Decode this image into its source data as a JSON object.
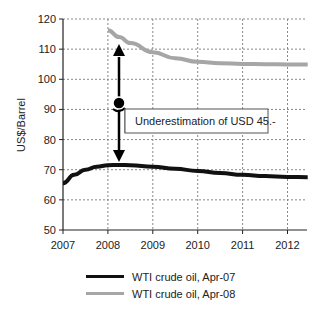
{
  "chart_data": {
    "type": "line",
    "title": "",
    "xlabel": "",
    "ylabel": "US$/Barrel",
    "xlim": [
      2007,
      2012.45
    ],
    "ylim": [
      50,
      120
    ],
    "x_ticks": [
      "2007",
      "2008",
      "2009",
      "2010",
      "2011",
      "2012"
    ],
    "y_ticks": [
      "50",
      "60",
      "70",
      "80",
      "90",
      "100",
      "110",
      "120"
    ],
    "grid": true,
    "legend_position": "bottom",
    "series": [
      {
        "name": "WTI crude oil, Apr-07",
        "color": "#111111",
        "x": [
          2007.0,
          2007.25,
          2007.5,
          2007.75,
          2008.0,
          2008.25,
          2008.5,
          2009.0,
          2009.5,
          2010.0,
          2010.5,
          2011.0,
          2011.5,
          2012.0,
          2012.45
        ],
        "values": [
          65.5,
          68.3,
          70.0,
          71.0,
          71.5,
          71.6,
          71.5,
          71.0,
          70.3,
          69.6,
          68.9,
          68.3,
          67.9,
          67.6,
          67.5
        ]
      },
      {
        "name": "WTI crude oil, Apr-08",
        "color": "#a6a6a6",
        "x": [
          2008.0,
          2008.25,
          2008.5,
          2009.0,
          2009.5,
          2010.0,
          2010.5,
          2011.0,
          2011.5,
          2012.0,
          2012.45
        ],
        "values": [
          116.3,
          114.0,
          112.0,
          109.0,
          107.0,
          105.8,
          105.3,
          105.1,
          105.0,
          104.9,
          104.9
        ]
      }
    ],
    "annotations": [
      {
        "text": "Underestimation of USD 45.-",
        "arrow_x": 2008.3,
        "arrow_from": 109.5,
        "arrow_to": 74.5,
        "marker_y": 91
      }
    ]
  },
  "legend": {
    "items": [
      {
        "label": "WTI crude oil, Apr-07",
        "color": "#111111"
      },
      {
        "label": "WTI crude oil, Apr-08",
        "color": "#a6a6a6"
      }
    ]
  }
}
